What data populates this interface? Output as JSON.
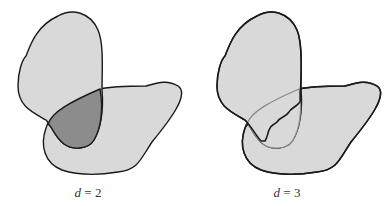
{
  "panels": [
    {
      "id": "left",
      "variable": "d",
      "equals": " = ",
      "value": "2",
      "description": "Two overlapping blobs; overlap region shaded darker"
    },
    {
      "id": "right",
      "variable": "d",
      "equals": " = ",
      "value": "3",
      "description": "Two overlapping blobs; overlap boundary drawn with lighter outline and a dark wavy dividing curve"
    }
  ],
  "colors": {
    "fill_light": "#d9d9d9",
    "fill_overlap": "#8c8c8c",
    "stroke_dark": "#1a1a1a",
    "stroke_light": "#8a8a8a",
    "background": "#ffffff"
  }
}
